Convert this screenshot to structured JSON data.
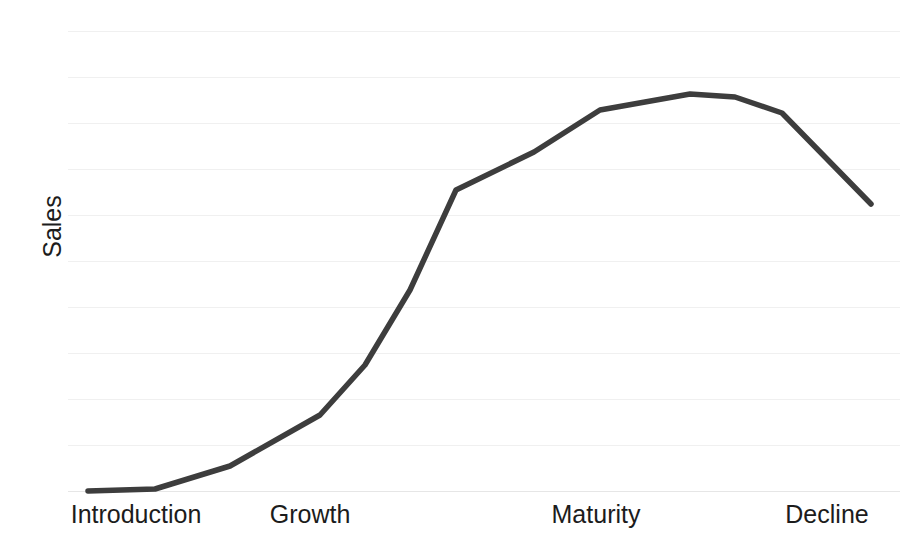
{
  "chart_data": {
    "type": "line",
    "title": "",
    "subtitle": "",
    "xlabel": "",
    "ylabel": "Sales",
    "grid": true,
    "legend": false,
    "legend_position": "none",
    "line_color": "#3d3d3d",
    "line_width": 5.5,
    "gridline_color": "#f0f0f0",
    "baseline_color": "#e6e6e6",
    "text_color": "#1c1c1c",
    "background": "#ffffff",
    "x_tick_labels": [
      "Introduction",
      "Growth",
      "Maturity",
      "Decline"
    ],
    "x_tick_positions_px": [
      136,
      310,
      596,
      827
    ],
    "xlim": [
      0,
      100
    ],
    "ylim": [
      0,
      100
    ],
    "y_gridline_count": 11,
    "y_gridline_positions_px": [
      31,
      77,
      123,
      169,
      215,
      261,
      307,
      353,
      399,
      445,
      491
    ],
    "annotations": [],
    "series": [
      {
        "name": "Sales",
        "color": "#3d3d3d",
        "x": [
          2.4,
          10.5,
          19.5,
          30.3,
          35.7,
          41.1,
          46.6,
          56.0,
          63.9,
          74.8,
          80.2,
          85.8,
          96.5
        ],
        "y": [
          0.0,
          0.4,
          5.4,
          16.3,
          26.7,
          43.4,
          65.5,
          73.6,
          79.6,
          82.3,
          81.7,
          78.3,
          59.5
        ],
        "points_px": [
          [
            88,
            491
          ],
          [
            155,
            489
          ],
          [
            230,
            466
          ],
          [
            320,
            415
          ],
          [
            365,
            365
          ],
          [
            410,
            290
          ],
          [
            456,
            190
          ],
          [
            534,
            152
          ],
          [
            600,
            110
          ],
          [
            690,
            94
          ],
          [
            735,
            97
          ],
          [
            782,
            113
          ],
          [
            871,
            204
          ]
        ]
      }
    ]
  }
}
